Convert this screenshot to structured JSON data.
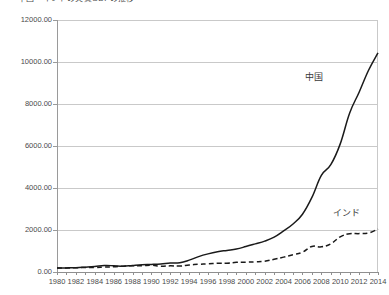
{
  "chart_data": {
    "type": "line",
    "title": "中国・インドの実質GDPの推移",
    "xlabel": "",
    "ylabel": "",
    "x": [
      1980,
      1981,
      1982,
      1983,
      1984,
      1985,
      1986,
      1987,
      1988,
      1989,
      1990,
      1991,
      1992,
      1993,
      1994,
      1995,
      1996,
      1997,
      1998,
      1999,
      2000,
      2001,
      2002,
      2003,
      2004,
      2005,
      2006,
      2007,
      2008,
      2009,
      2010,
      2011,
      2012,
      2013,
      2014
    ],
    "xlim": [
      1980,
      2014
    ],
    "ylim": [
      0,
      12000
    ],
    "ytick_labels": [
      "0.00",
      "2000.00",
      "4000.00",
      "6000.00",
      "8000.00",
      "10000.00",
      "12000.00"
    ],
    "ytick_values": [
      0,
      2000,
      4000,
      6000,
      8000,
      10000,
      12000
    ],
    "xtick_labels": [
      "1980",
      "1982",
      "1984",
      "1986",
      "1988",
      "1990",
      "1992",
      "1994",
      "1996",
      "1998",
      "2000",
      "2002",
      "2004",
      "2006",
      "2008",
      "2010",
      "2012",
      "2014"
    ],
    "xtick_values": [
      1980,
      1982,
      1984,
      1986,
      1988,
      1990,
      1992,
      1994,
      1996,
      1998,
      2000,
      2002,
      2004,
      2006,
      2008,
      2010,
      2012,
      2014
    ],
    "grid": true,
    "legend": "inline-annotations",
    "series": [
      {
        "name": "中国",
        "style": "solid",
        "color": "#1a1a1a",
        "values": [
          191,
          196,
          205,
          230,
          260,
          307,
          298,
          272,
          310,
          344,
          360,
          383,
          427,
          444,
          564,
          734,
          863,
          962,
          1029,
          1094,
          1211,
          1339,
          1471,
          1660,
          1955,
          2286,
          2752,
          3552,
          4598,
          5110,
          6101,
          7573,
          8560,
          9607,
          10438
        ]
      },
      {
        "name": "インド",
        "style": "dashed",
        "color": "#1a1a1a",
        "values": [
          186,
          194,
          201,
          219,
          212,
          232,
          248,
          278,
          297,
          296,
          321,
          274,
          293,
          284,
          333,
          366,
          392,
          415,
          421,
          459,
          468,
          485,
          514,
          607,
          709,
          820,
          940,
          1217,
          1199,
          1342,
          1676,
          1823,
          1828,
          1857,
          2042
        ]
      }
    ],
    "annotations": [
      {
        "text": "中国",
        "series": "中国"
      },
      {
        "text": "インド",
        "series": "インド"
      }
    ]
  },
  "colors": {
    "gridline": "#c9c9c9",
    "axis": "#8f8f8f",
    "text": "#4a4a4a",
    "series_line": "#1a1a1a",
    "background": "#ffffff"
  }
}
